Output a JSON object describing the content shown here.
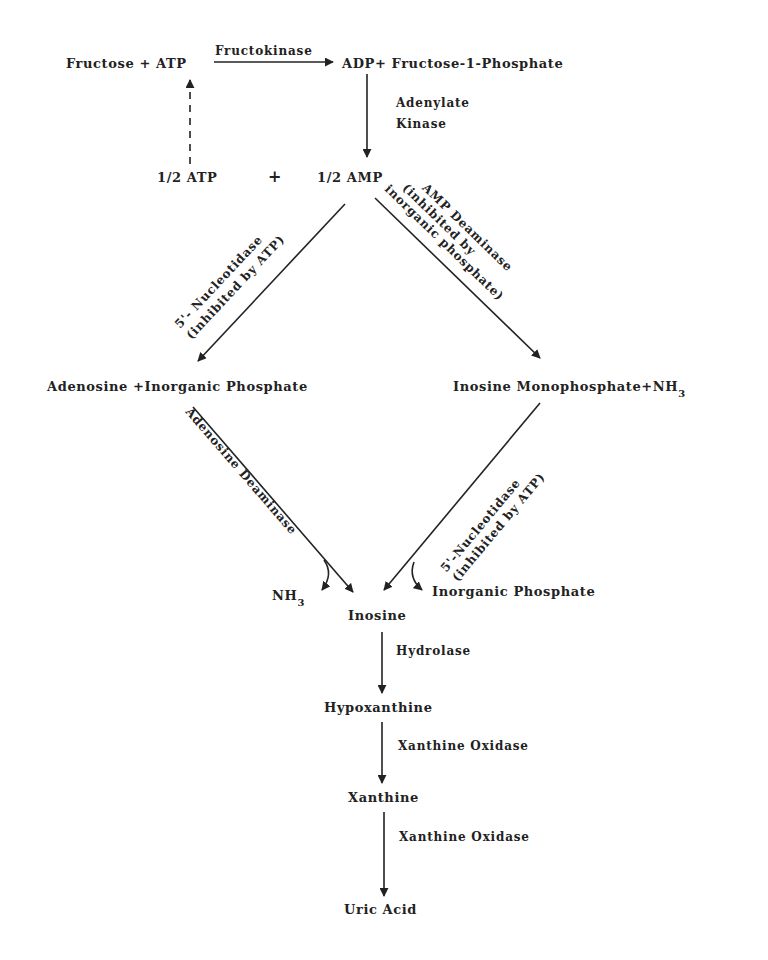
{
  "diagram": {
    "nodes": {
      "fructose_atp": "Fructose + ATP",
      "adp_f1p": "ADP+ Fructose-1-Phosphate",
      "half_atp": "1/2 ATP",
      "plus": "+",
      "half_amp": "1/2 AMP",
      "adenosine_pi": "Adenosine +Inorganic Phosphate",
      "imp_nh3_main": "Inosine Monophosphate+NH",
      "imp_nh3_sub": "3",
      "nh3_main": "NH",
      "nh3_sub": "3",
      "inosine": "Inosine",
      "inorganic_phosphate": "Inorganic Phosphate",
      "hypoxanthine": "Hypoxanthine",
      "xanthine": "Xanthine",
      "uric_acid": "Uric Acid"
    },
    "enzymes": {
      "fructokinase": "Fructokinase",
      "adenylate_kinase_1": "Adenylate",
      "adenylate_kinase_2": "Kinase",
      "nucleotidase_left_1": "5'- Nucleotidase",
      "nucleotidase_left_2": "(inhibited by ATP)",
      "amp_deaminase_1": "AMP Deaminase",
      "amp_deaminase_2": "(inhibited by",
      "amp_deaminase_3": "inorganic phosphate)",
      "adenosine_deaminase": "Adenosine Deaminase",
      "nucleotidase_right_1": "5'-Nucleotidase",
      "nucleotidase_right_2": "(inhibited by ATP)",
      "hydrolase": "Hydrolase",
      "xanthine_oxidase_1": "Xanthine Oxidase",
      "xanthine_oxidase_2": "Xanthine Oxidase"
    },
    "edges": [
      {
        "from": "Fructose + ATP",
        "to": "ADP+ Fructose-1-Phosphate",
        "label": "Fructokinase"
      },
      {
        "from": "ADP+ Fructose-1-Phosphate",
        "to": "1/2 AMP",
        "label": "Adenylate Kinase"
      },
      {
        "from": "1/2 ATP",
        "to": "ATP",
        "label": "",
        "style": "dashed"
      },
      {
        "from": "1/2 AMP",
        "to": "Adenosine +Inorganic Phosphate",
        "label": "5'- Nucleotidase (inhibited by ATP)"
      },
      {
        "from": "1/2 AMP",
        "to": "Inosine Monophosphate+NH3",
        "label": "AMP Deaminase (inhibited by inorganic phosphate)"
      },
      {
        "from": "Adenosine +Inorganic Phosphate",
        "to": "Inosine",
        "label": "Adenosine Deaminase",
        "byproduct": "NH3"
      },
      {
        "from": "Inosine Monophosphate+NH3",
        "to": "Inosine",
        "label": "5'-Nucleotidase (inhibited by ATP)",
        "byproduct": "Inorganic Phosphate"
      },
      {
        "from": "Inosine",
        "to": "Hypoxanthine",
        "label": "Hydrolase"
      },
      {
        "from": "Hypoxanthine",
        "to": "Xanthine",
        "label": "Xanthine Oxidase"
      },
      {
        "from": "Xanthine",
        "to": "Uric Acid",
        "label": "Xanthine Oxidase"
      }
    ]
  }
}
